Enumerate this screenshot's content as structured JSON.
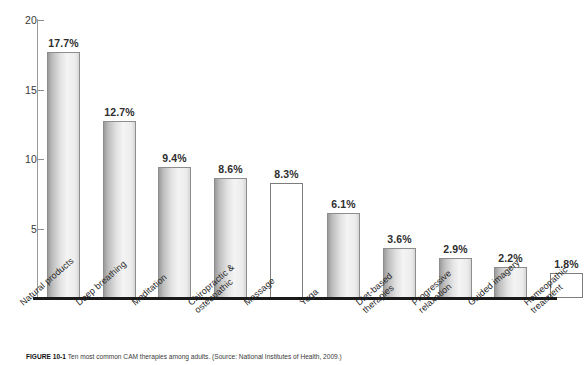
{
  "figure": {
    "caption_label": "FIGURE 10-1",
    "caption_text": "Ten most common CAM therapies among adults. (Source: National Institutes of Health, 2009.)"
  },
  "chart_data": {
    "type": "bar",
    "title": "",
    "xlabel": "",
    "ylabel": "",
    "ylim": [
      0,
      20
    ],
    "yticks": [
      5,
      10,
      15,
      20
    ],
    "ytick_labels": [
      "5",
      "10",
      "15",
      "20"
    ],
    "grid": false,
    "legend": null,
    "categories": [
      "Natural products",
      "Deep breathing",
      "Meditation",
      "Chiropractic & osteopathic",
      "Massage",
      "Yoga",
      "Diet-based therapies",
      "Progressive relaxation",
      "Guided imagery",
      "Homeopathic treatment"
    ],
    "category_lines": [
      [
        "Natural products"
      ],
      [
        "Deep breathing"
      ],
      [
        "Meditation"
      ],
      [
        "Chiropractic &",
        "osteopathic"
      ],
      [
        "Massage"
      ],
      [
        "Yoga"
      ],
      [
        "Diet-based",
        "therapies"
      ],
      [
        "Progressive",
        "relaxation"
      ],
      [
        "Guided imagery"
      ],
      [
        "Homeopathic",
        "treatment"
      ]
    ],
    "values": [
      17.7,
      12.7,
      9.4,
      8.6,
      8.3,
      6.1,
      3.6,
      2.9,
      2.2,
      1.8
    ],
    "data_labels": [
      "17.7%",
      "12.7%",
      "9.4%",
      "8.6%",
      "8.3%",
      "6.1%",
      "3.6%",
      "2.9%",
      "2.2%",
      "1.8%"
    ],
    "bar_fill_styles": [
      "gradient",
      "gradient",
      "gradient",
      "gradient",
      "plain",
      "gradient",
      "gradient",
      "gradient",
      "gradient",
      "plain"
    ],
    "colors": {
      "bar_gradient_dark": "#9b9b9b",
      "bar_gradient_light": "#f4f4f4",
      "bar_border": "#8d8d8d",
      "axis_baseline": "#1a1a1a",
      "axis_line": "#9a9a9a",
      "text": "#2b2b2b",
      "background": "#ffffff"
    }
  }
}
